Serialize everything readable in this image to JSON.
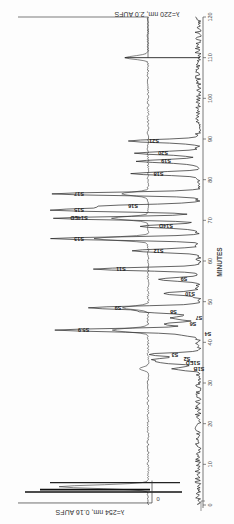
{
  "chart_data": {
    "type": "line",
    "orientation_note": "Figure printed rotated 180 degrees; time axis vertical along right edge, peaks extend leftward",
    "title": "",
    "xlabel": "MINUTES",
    "ylabel": "Absorbance",
    "xlim": [
      0,
      120
    ],
    "x_ticks": [
      0,
      10,
      20,
      30,
      40,
      50,
      60,
      70,
      80,
      90,
      100,
      110,
      120
    ],
    "series": [
      {
        "name": "λ=220 nm, 2.0 AUFS",
        "role": "upper trace (main, labeled peaks)",
        "peaks": [
          {
            "label": "S1B",
            "time": 33.5,
            "height": 0.18
          },
          {
            "label": "S1ED",
            "time": 35.0,
            "height": 0.22
          },
          {
            "label": "S2",
            "time": 35.8,
            "height": 0.26
          },
          {
            "label": "S3",
            "time": 37.0,
            "height": 0.34
          },
          {
            "label": "S4",
            "time": 42.0,
            "height": 0.12
          },
          {
            "label": "S5.9",
            "time": 43.0,
            "height": 0.95
          },
          {
            "label": "S6",
            "time": 44.5,
            "height": 0.22
          },
          {
            "label": "S7",
            "time": 46.0,
            "height": 0.18
          },
          {
            "label": "S8",
            "time": 47.5,
            "height": 0.35
          },
          {
            "label": "S9",
            "time": 48.5,
            "height": 0.72
          },
          {
            "label": "S10",
            "time": 52.0,
            "height": 0.24
          },
          {
            "label": "S9",
            "time": 55.5,
            "height": 0.28
          },
          {
            "label": "S11",
            "time": 58.0,
            "height": 0.7
          },
          {
            "label": "S12",
            "time": 62.5,
            "height": 0.45
          },
          {
            "label": "S13",
            "time": 65.5,
            "height": 0.98
          },
          {
            "label": "S14D",
            "time": 68.5,
            "height": 0.4
          },
          {
            "label": "S14ED",
            "time": 70.5,
            "height": 0.98
          },
          {
            "label": "S15",
            "time": 72.5,
            "height": 0.98
          },
          {
            "label": "S16",
            "time": 73.5,
            "height": 0.62
          },
          {
            "label": "S17",
            "time": 76.5,
            "height": 0.98
          },
          {
            "label": "S18",
            "time": 81.5,
            "height": 0.45
          },
          {
            "label": "S19",
            "time": 84.5,
            "height": 0.4
          },
          {
            "label": "S20",
            "time": 86.5,
            "height": 0.42
          },
          {
            "label": "S21",
            "time": 89.5,
            "height": 0.48
          }
        ]
      },
      {
        "name": "λ=254 nm, 0.16 AUFS",
        "role": "lower trace (offset baseline)",
        "peaks": [
          {
            "label": "",
            "time": 4.5,
            "height": 0.98
          },
          {
            "label": "",
            "time": 33.5,
            "height": 0.1
          },
          {
            "label": "",
            "time": 43.0,
            "height": 0.4
          },
          {
            "label": "",
            "time": 48.5,
            "height": 0.28
          },
          {
            "label": "",
            "time": 65.5,
            "height": 0.6
          },
          {
            "label": "",
            "time": 70.5,
            "height": 0.4
          },
          {
            "label": "",
            "time": 76.5,
            "height": 0.3
          },
          {
            "label": "",
            "time": 110.0,
            "height": 0.25
          }
        ]
      }
    ],
    "annotations": [
      {
        "text": "λ=220 nm, 2.0 AUFS",
        "position": "top"
      },
      {
        "text": "λ=254 nm, 0.16 AUFS",
        "position": "bottom"
      },
      {
        "text": "0",
        "position": "bottom-left baseline marker"
      }
    ],
    "grid": false,
    "legend": null
  },
  "labels": {
    "top_caption": "λ=220 nm, 2.0 AUFS",
    "bottom_caption": "λ=254 nm, 0.16 AUFS",
    "axis_title": "MINUTES",
    "zero_marker": "0",
    "ticks": [
      "0",
      "10",
      "20",
      "30",
      "40",
      "50",
      "60",
      "70",
      "80",
      "90",
      "100",
      "110",
      "120"
    ]
  }
}
